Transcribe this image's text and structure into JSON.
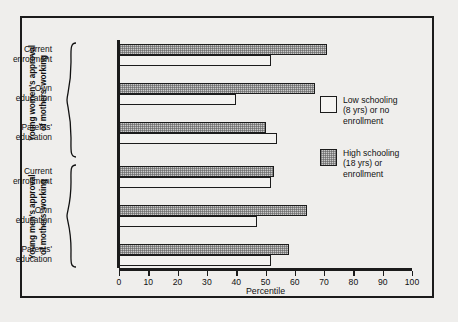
{
  "chart_data": {
    "type": "bar",
    "orientation": "horizontal",
    "title": "",
    "xlabel": "Percentile",
    "ylabel": "",
    "xlim": [
      0,
      100
    ],
    "xticks": [
      0,
      10,
      20,
      30,
      40,
      50,
      60,
      70,
      80,
      90,
      100
    ],
    "grid": false,
    "legend_position": "right",
    "legend": [
      "Low schooling\n(8 yrs) or no\nenrollment",
      "High schooling\n(18 yrs) or\nenrollment"
    ],
    "series": [
      {
        "name": "Low schooling (8 yrs) or no enrollment",
        "values": [
          52,
          40,
          54,
          52,
          47,
          52
        ]
      },
      {
        "name": "High schooling (18 yrs) or enrollment",
        "values": [
          71,
          67,
          50,
          53,
          64,
          58
        ]
      }
    ],
    "categories": [
      "Current enrollment",
      "Own education",
      "Parents' education",
      "Current enrollment",
      "Own education",
      "Parents' education"
    ],
    "groups": [
      {
        "label": "Young women's approval\nof mothers' working",
        "categories": [
          0,
          1,
          2
        ]
      },
      {
        "label": "Young men's approval\nof mothers' working",
        "categories": [
          3,
          4,
          5
        ]
      }
    ]
  },
  "axis": {
    "x_title": "Percentile",
    "tick_labels": [
      "0",
      "10",
      "20",
      "30",
      "40",
      "50",
      "60",
      "70",
      "80",
      "90",
      "100"
    ]
  },
  "groups": [
    {
      "super_label": "Young women's approval\nof mothers' working",
      "items": [
        {
          "label": "Current\nenrollment",
          "low": 52,
          "high": 71
        },
        {
          "label": "Own\neducation",
          "low": 40,
          "high": 67
        },
        {
          "label": "Parents'\neducation",
          "low": 54,
          "high": 50
        }
      ]
    },
    {
      "super_label": "Young men's approval\nof mothers' working",
      "items": [
        {
          "label": "Current\nenrollment",
          "low": 52,
          "high": 53
        },
        {
          "label": "Own\neducation",
          "low": 47,
          "high": 64
        },
        {
          "label": "Parents'\neducation",
          "low": 52,
          "high": 58
        }
      ]
    }
  ],
  "legend": {
    "low": {
      "label": "Low schooling\n(8 yrs) or no\nenrollment"
    },
    "high": {
      "label": "High schooling\n(18 yrs) or\nenrollment"
    }
  },
  "colors": {
    "background": "#efeeec",
    "frame": "#1b1b1b",
    "low_fill": "#f3f2f0",
    "high_fill": "#c9c9c9",
    "text": "#111111"
  }
}
